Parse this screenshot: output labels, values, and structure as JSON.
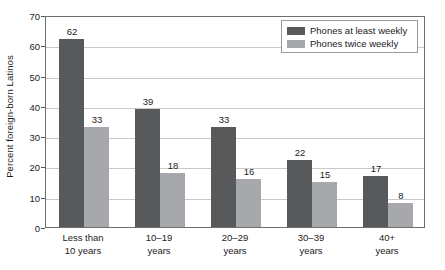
{
  "chart_data": {
    "type": "bar",
    "title": "",
    "xlabel": "",
    "ylabel": "Percent foreign-born Latinos",
    "ylim": [
      0,
      70
    ],
    "yticks": [
      0,
      10,
      20,
      30,
      40,
      50,
      60,
      70
    ],
    "grid": true,
    "legend_position": "top-right",
    "categories": [
      "Less than 10 years",
      "10–19 years",
      "20–29 years",
      "30–39 years",
      "40+ years"
    ],
    "category_lines": [
      [
        "Less than",
        "10 years"
      ],
      [
        "10–19",
        "years"
      ],
      [
        "20–29",
        "years"
      ],
      [
        "30–39",
        "years"
      ],
      [
        "40+",
        "years"
      ]
    ],
    "series": [
      {
        "name": "Phones at least weekly",
        "color": "#58595b",
        "values": [
          62,
          39,
          33,
          22,
          17
        ]
      },
      {
        "name": "Phones twice weekly",
        "color": "#a6a8ab",
        "values": [
          33,
          18,
          16,
          15,
          8
        ]
      }
    ]
  },
  "colors": {
    "series_dark": "#58595b",
    "series_light": "#a6a8ab",
    "gridline": "#c9c9c9",
    "axis_border": "#6d6e70",
    "text": "#1b1b1b",
    "background": "#ffffff"
  }
}
